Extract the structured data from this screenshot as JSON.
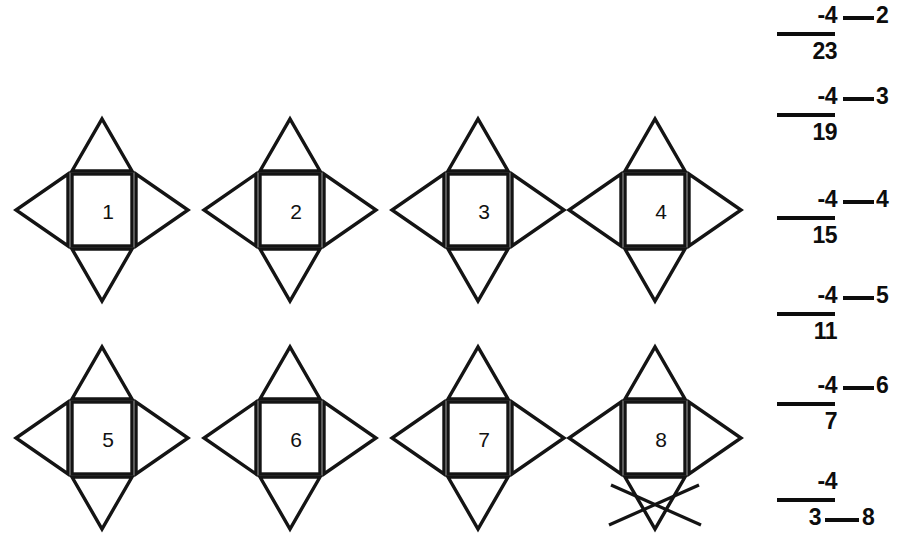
{
  "page": {
    "width": 903,
    "height": 557,
    "background": "#ffffff",
    "ink_color": "#141414"
  },
  "shapes": {
    "description": "Eight identical cross figures, each a square with four outward-pointing triangles (up, right, down, left). The square holds the item number.",
    "rows": 2,
    "columns": 4,
    "items": [
      {
        "number": "1",
        "col": 0,
        "row": 0,
        "crossed_out": false
      },
      {
        "number": "2",
        "col": 1,
        "row": 0,
        "crossed_out": false
      },
      {
        "number": "3",
        "col": 2,
        "row": 0,
        "crossed_out": false
      },
      {
        "number": "4",
        "col": 3,
        "row": 0,
        "crossed_out": false
      },
      {
        "number": "5",
        "col": 0,
        "row": 1,
        "crossed_out": false
      },
      {
        "number": "6",
        "col": 1,
        "row": 1,
        "crossed_out": false
      },
      {
        "number": "7",
        "col": 2,
        "row": 1,
        "crossed_out": false
      },
      {
        "number": "8",
        "col": 3,
        "row": 1,
        "crossed_out": true
      }
    ]
  },
  "problems": {
    "description": "Column of vertical subtraction problems; each shows a subtrahend over a rule with a number below, and a blank rule leading to the item index.",
    "items": [
      {
        "top": "-4",
        "bottom": "23",
        "index": "2",
        "answered": false
      },
      {
        "top": "-4",
        "bottom": "19",
        "index": "3",
        "answered": false
      },
      {
        "top": "-4",
        "bottom": "15",
        "index": "4",
        "answered": false
      },
      {
        "top": "-4",
        "bottom": "11",
        "index": "5",
        "answered": false
      },
      {
        "top": "-4",
        "bottom": "7",
        "index": "6",
        "answered": false
      },
      {
        "top": "-4",
        "bottom": "3",
        "index": "7",
        "answered": true,
        "answer_index": "8"
      }
    ]
  }
}
